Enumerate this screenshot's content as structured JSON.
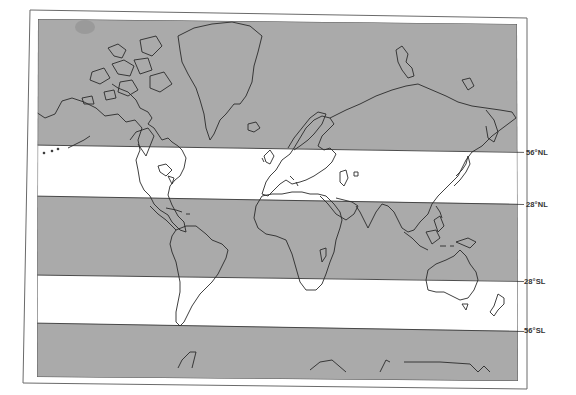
{
  "map": {
    "type": "world-map-mercator",
    "style": {
      "shaded_band_color": "#aaaaaa",
      "unshaded_band_color": "#ffffff",
      "coastline_color": "#2a2a2a",
      "frame_color": "#555555"
    },
    "bands": [
      {
        "name": "north-polar-band",
        "range": "above 56°N",
        "shaded": true
      },
      {
        "name": "north-temperate-band",
        "range": "28°N – 56°N",
        "shaded": false
      },
      {
        "name": "tropical-band",
        "range": "28°S – 28°N",
        "shaded": true
      },
      {
        "name": "south-temperate-band",
        "range": "28°S – 56°S",
        "shaded": false
      },
      {
        "name": "south-polar-band",
        "range": "below 56°S",
        "shaded": true
      }
    ],
    "latitude_labels": {
      "n56": "56°NL",
      "n28": "28°NL",
      "s28": "28°SL",
      "s56": "56°SL"
    }
  }
}
